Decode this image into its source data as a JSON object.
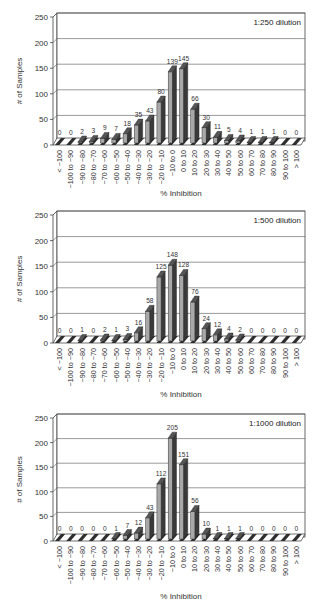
{
  "chart_data": [
    {
      "type": "bar",
      "title": "1:250 dilution",
      "xlabel": "% Inhibition",
      "ylabel": "# of Samples",
      "ylim": [
        0,
        250
      ],
      "yticks": [
        "0",
        "50",
        "100",
        "150",
        "200",
        "250"
      ],
      "grid": true,
      "annotation_placement": "top-right",
      "categories": [
        "< −100",
        "−100 to −90",
        "−90 to −80",
        "−80 to −70",
        "−70 to −60",
        "−60 to −50",
        "−50 to −40",
        "−40 to −30",
        "−30 to −20",
        "−20 to −10",
        "−10 to 0",
        "0 to 10",
        "10 to 20",
        "20 to 30",
        "30 to 40",
        "40 to 50",
        "50 to 60",
        "60 to 70",
        "70 to 80",
        "80 to 90",
        "90 to 100",
        "> 100"
      ],
      "values": [
        0,
        0,
        2,
        3,
        9,
        7,
        18,
        35,
        43,
        80,
        139,
        145,
        66,
        30,
        11,
        5,
        4,
        1,
        1,
        1,
        0,
        0
      ]
    },
    {
      "type": "bar",
      "title": "1:500 dilution",
      "xlabel": "% Inhibition",
      "ylabel": "# of Samples",
      "ylim": [
        0,
        250
      ],
      "yticks": [
        "0",
        "50",
        "100",
        "150",
        "200",
        "250"
      ],
      "grid": true,
      "annotation_placement": "top-right",
      "categories": [
        "< −100",
        "−100 to −90",
        "−90 to −80",
        "−80 to −70",
        "−70 to −60",
        "−60 to −50",
        "−50 to −40",
        "−40 to −30",
        "−30 to −20",
        "−20 to −10",
        "−10 to 0",
        "0 to 10",
        "10 to 20",
        "20 to 30",
        "30 to 40",
        "40 to 50",
        "50 to 60",
        "60 to 70",
        "70 to 80",
        "80 to 90",
        "90 to 100",
        "> 100"
      ],
      "values": [
        0,
        0,
        1,
        0,
        2,
        1,
        3,
        16,
        58,
        125,
        148,
        128,
        76,
        24,
        12,
        4,
        2,
        0,
        0,
        0,
        0,
        0
      ]
    },
    {
      "type": "bar",
      "title": "1:1000 dilution",
      "xlabel": "% Inhibition",
      "ylabel": "# of Samples",
      "ylim": [
        0,
        250
      ],
      "yticks": [
        "0",
        "50",
        "100",
        "150",
        "200",
        "250"
      ],
      "grid": true,
      "annotation_placement": "top-right",
      "categories": [
        "< −100",
        "−100 to −90",
        "−90 to −80",
        "−80 to −70",
        "−70 to −60",
        "−60 to −50",
        "−50 to −40",
        "−40 to −30",
        "−30 to −20",
        "−20 to −10",
        "−10 to 0",
        "0 to 10",
        "10 to 20",
        "20 to 30",
        "30 to 40",
        "40 to 50",
        "50 to 60",
        "60 to 70",
        "70 to 80",
        "80 to 90",
        "90 to 100",
        "> 100"
      ],
      "values": [
        0,
        0,
        0,
        0,
        0,
        1,
        7,
        12,
        43,
        112,
        205,
        151,
        56,
        10,
        1,
        1,
        1,
        0,
        0,
        0,
        0,
        0
      ]
    }
  ],
  "colors": {
    "bar_front": "#a8a8a8",
    "bar_side": "#3a3a3a",
    "bar_top": "#555555",
    "floor_stripe": "#2e2e2e",
    "grid": "#555555"
  }
}
